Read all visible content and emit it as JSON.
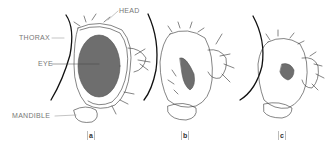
{
  "figure": {
    "labels": {
      "head": "HEAD",
      "thorax": "THORAX",
      "eye": "EYE",
      "mandible": "MANDIBLE"
    },
    "panels": [
      {
        "id": "a",
        "label": "a",
        "eye_size": "large"
      },
      {
        "id": "b",
        "label": "b",
        "eye_size": "medium"
      },
      {
        "id": "c",
        "label": "c",
        "eye_size": "small"
      }
    ],
    "colors": {
      "outline": "#222222",
      "eye_fill": "#6e6e6e",
      "label_text": "#777777",
      "leader_line": "#888888"
    }
  }
}
